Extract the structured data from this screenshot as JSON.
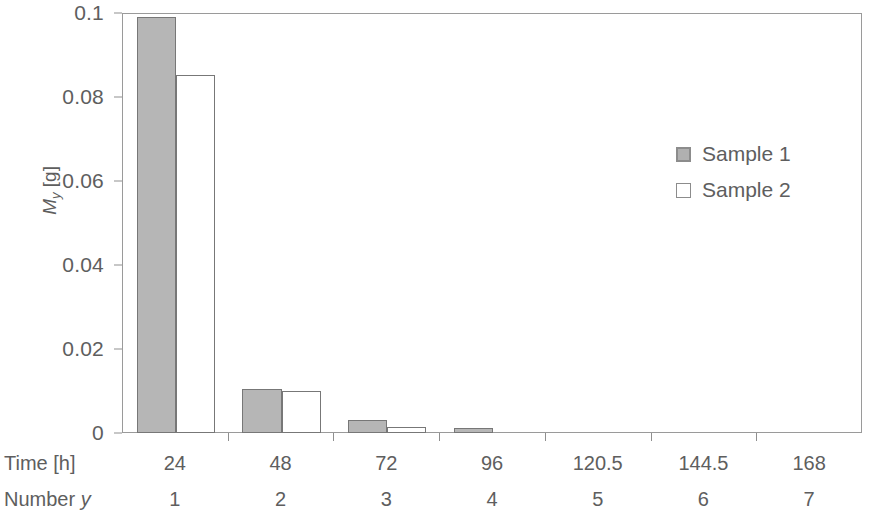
{
  "chart_data": {
    "type": "bar",
    "title": "",
    "subtitle": "",
    "xlabel": "Time [h]",
    "ylabel": "M_y [g]",
    "ylabel_parts": {
      "symbol": "M",
      "subscript": "y",
      "unit": "[g]"
    },
    "categories": [
      "24",
      "48",
      "72",
      "96",
      "120.5",
      "144.5",
      "168"
    ],
    "category_numbers": [
      "1",
      "2",
      "3",
      "4",
      "5",
      "6",
      "7"
    ],
    "category_row_label": "Time [h]",
    "number_row_label": "Number y",
    "number_row_label_parts": {
      "text": "Number",
      "italic": "y"
    },
    "series": [
      {
        "name": "Sample 1",
        "color": "#b6b6b6",
        "values": [
          0.099,
          0.0105,
          0.0031,
          0.0013,
          0,
          0,
          0
        ]
      },
      {
        "name": "Sample 2",
        "color": "#ffffff",
        "values": [
          0.0852,
          0.01,
          0.0014,
          0,
          0,
          0,
          0
        ]
      }
    ],
    "ylim": [
      0,
      0.1
    ],
    "yticks": [
      0,
      0.02,
      0.04,
      0.06,
      0.08,
      0.1
    ],
    "ytick_labels": [
      "0",
      "0.02",
      "0.04",
      "0.06",
      "0.08",
      "0.1"
    ],
    "grid": false,
    "legend_position": "upper right",
    "legend_entries": [
      "Sample 1",
      "Sample 2"
    ],
    "frame": true,
    "axis_color": "#9a9a9a",
    "text_color": "#5e5e5e",
    "bar_border_color": "#777777"
  }
}
